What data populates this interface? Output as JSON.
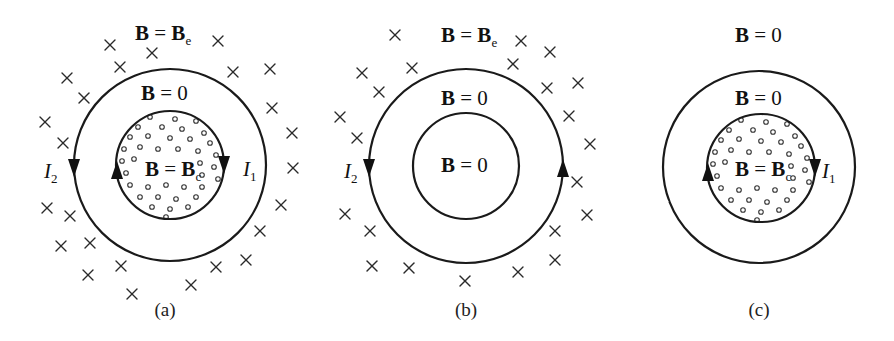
{
  "figure": {
    "background": "#ffffff",
    "ink": "#111111",
    "panels": [
      {
        "id": "a",
        "caption": "(a)",
        "caption_pos": [
          165,
          316
        ],
        "outer_circle": {
          "cx": 170,
          "cy": 165,
          "r": 96
        },
        "inner_circle": {
          "cx": 170,
          "cy": 165,
          "r": 54
        },
        "inner_filled_with_dots": true,
        "labels": {
          "outside": {
            "lhs": "B",
            "eq": " = ",
            "rhs": "B",
            "sub": "e",
            "pos": [
              135,
              40
            ]
          },
          "annulus": {
            "lhs": "B",
            "eq": " = ",
            "rhs": "0",
            "pos": [
              141,
              100
            ]
          },
          "core": {
            "lhs": "B",
            "eq": " = ",
            "rhs": "B",
            "sub": "c",
            "pos": [
              145,
              176
            ]
          }
        },
        "currents": [
          {
            "name": "I",
            "sub": "2",
            "label_pos": [
              44,
              178
            ],
            "arrow_at": [
              74,
              168
            ],
            "direction": "down"
          },
          {
            "name": "I",
            "sub": "1",
            "label_pos": [
              243,
              176
            ],
            "arrow_at": [
              224,
              165
            ],
            "direction": "down"
          },
          {
            "name": "",
            "sub": "",
            "label_pos": null,
            "arrow_at": [
              117,
              170
            ],
            "direction": "up"
          }
        ],
        "crosses": [
          [
            110,
            45
          ],
          [
            152,
            53
          ],
          [
            120,
            67
          ],
          [
            218,
            41
          ],
          [
            67,
            78
          ],
          [
            84,
            98
          ],
          [
            233,
            72
          ],
          [
            270,
            69
          ],
          [
            45,
            122
          ],
          [
            63,
            143
          ],
          [
            272,
            108
          ],
          [
            292,
            133
          ],
          [
            293,
            168
          ],
          [
            281,
            205
          ],
          [
            260,
            231
          ],
          [
            246,
            260
          ],
          [
            47,
            208
          ],
          [
            70,
            216
          ],
          [
            61,
            246
          ],
          [
            90,
            243
          ],
          [
            88,
            275
          ],
          [
            121,
            266
          ],
          [
            132,
            294
          ],
          [
            191,
            285
          ],
          [
            216,
            267
          ]
        ],
        "gap": null
      },
      {
        "id": "b",
        "caption": "(b)",
        "caption_pos": [
          466,
          316
        ],
        "outer_circle": {
          "cx": 466,
          "cy": 166,
          "r": 97
        },
        "inner_circle": {
          "cx": 466,
          "cy": 166,
          "r": 53
        },
        "inner_filled_with_dots": false,
        "labels": {
          "outside": {
            "lhs": "B",
            "eq": " = ",
            "rhs": "B",
            "sub": "e",
            "pos": [
              441,
              42
            ]
          },
          "annulus": {
            "lhs": "B",
            "eq": " = ",
            "rhs": "0",
            "pos": [
              441,
              105
            ]
          },
          "core": {
            "lhs": "B",
            "eq": " = ",
            "rhs": "0",
            "pos": [
              441,
              172
            ]
          }
        },
        "currents": [
          {
            "name": "I",
            "sub": "2",
            "label_pos": [
              344,
              178
            ],
            "arrow_at": [
              369,
              168
            ],
            "direction": "down"
          },
          {
            "name": "",
            "sub": "",
            "label_pos": null,
            "arrow_at": [
              563,
              168
            ],
            "direction": "up"
          }
        ],
        "crosses": [
          [
            395,
            35
          ],
          [
            362,
            73
          ],
          [
            412,
            68
          ],
          [
            379,
            92
          ],
          [
            340,
            117
          ],
          [
            357,
            138
          ],
          [
            521,
            41
          ],
          [
            513,
            64
          ],
          [
            550,
            52
          ],
          [
            547,
            88
          ],
          [
            578,
            83
          ],
          [
            569,
            116
          ],
          [
            590,
            144
          ],
          [
            577,
            182
          ],
          [
            587,
            215
          ],
          [
            555,
            231
          ],
          [
            555,
            260
          ],
          [
            518,
            272
          ],
          [
            465,
            281
          ],
          [
            409,
            268
          ],
          [
            372,
            266
          ],
          [
            370,
            231
          ],
          [
            345,
            214
          ]
        ],
        "gap": null
      },
      {
        "id": "c",
        "caption": "(c)",
        "caption_pos": [
          759,
          316
        ],
        "outer_circle": {
          "cx": 759,
          "cy": 167,
          "r": 96
        },
        "inner_circle": {
          "cx": 761,
          "cy": 168,
          "r": 54
        },
        "inner_filled_with_dots": true,
        "labels": {
          "outside": {
            "lhs": "B",
            "eq": " = ",
            "rhs": "0",
            "pos": [
              735,
              42
            ]
          },
          "annulus": {
            "lhs": "B",
            "eq": " = ",
            "rhs": "0",
            "pos": [
              735,
              105
            ]
          },
          "core": {
            "lhs": "B",
            "eq": " = ",
            "rhs": "B",
            "sub": "c",
            "pos": [
              735,
              176
            ]
          }
        },
        "currents": [
          {
            "name": "I",
            "sub": "1",
            "label_pos": [
              822,
              178
            ],
            "arrow_at": [
              815,
              168
            ],
            "direction": "down"
          },
          {
            "name": "",
            "sub": "",
            "label_pos": null,
            "arrow_at": [
              708,
              172
            ],
            "direction": "up"
          }
        ],
        "crosses": [],
        "gap": {
          "x": 664,
          "y": 200
        }
      }
    ],
    "dot_pattern": [
      [
        -20,
        -48
      ],
      [
        5,
        -46
      ],
      [
        26,
        -44
      ],
      [
        -32,
        -38
      ],
      [
        -8,
        -38
      ],
      [
        12,
        -36
      ],
      [
        34,
        -32
      ],
      [
        -40,
        -28
      ],
      [
        -22,
        -29
      ],
      [
        0,
        -27
      ],
      [
        20,
        -26
      ],
      [
        40,
        -22
      ],
      [
        -46,
        -16
      ],
      [
        -30,
        -18
      ],
      [
        -12,
        -16
      ],
      [
        8,
        -16
      ],
      [
        28,
        -14
      ],
      [
        46,
        -10
      ],
      [
        -48,
        -4
      ],
      [
        -36,
        -6
      ],
      [
        30,
        -2
      ],
      [
        44,
        2
      ],
      [
        -44,
        8
      ],
      [
        -30,
        10
      ],
      [
        32,
        10
      ],
      [
        48,
        14
      ],
      [
        -40,
        20
      ],
      [
        -22,
        22
      ],
      [
        -4,
        20
      ],
      [
        14,
        22
      ],
      [
        32,
        22
      ],
      [
        -30,
        32
      ],
      [
        -12,
        32
      ],
      [
        6,
        34
      ],
      [
        26,
        32
      ],
      [
        -18,
        42
      ],
      [
        0,
        44
      ],
      [
        18,
        42
      ],
      [
        -4,
        52
      ]
    ]
  }
}
